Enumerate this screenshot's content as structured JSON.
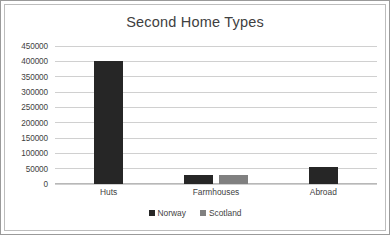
{
  "chart_data": {
    "type": "bar",
    "title": "Second Home Types",
    "xlabel": "",
    "ylabel": "",
    "categories": [
      "Huts",
      "Farmhouses",
      "Abroad"
    ],
    "series": [
      {
        "name": "Norway",
        "color": "#262626",
        "values": [
          400000,
          30000,
          55000
        ]
      },
      {
        "name": "Scotland",
        "color": "#808080",
        "values": [
          null,
          29000,
          null
        ]
      }
    ],
    "ylim": [
      0,
      450000
    ],
    "ytick_values": [
      0,
      50000,
      100000,
      150000,
      200000,
      250000,
      300000,
      350000,
      400000,
      450000
    ],
    "ytick_labels": [
      "0",
      "50000",
      "100000",
      "150000",
      "200000",
      "250000",
      "300000",
      "350000",
      "400000",
      "450000"
    ],
    "grid": true,
    "legend_position": "bottom"
  },
  "style": {
    "plot_background": "#ffffff",
    "gridline_color": "#d0d0d0",
    "outer_border_color": "#9a9a9a",
    "inner_border_color": "#bdbdbd",
    "text_color": "#3f3f3f",
    "title_color": "#404040"
  }
}
